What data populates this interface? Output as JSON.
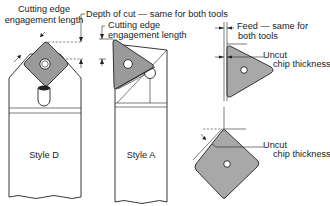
{
  "figure": {
    "labels": {
      "cutting_edge_engagement_length_left": [
        "Cutting edge",
        "engagement length"
      ],
      "depth_of_cut": "Depth of cut — same for both tools",
      "cutting_edge_engagement_length_center": [
        "Cutting edge",
        "engagement length"
      ],
      "feed": [
        "Feed — same for",
        "both tools"
      ],
      "uncut_chip_thickness_top": [
        "Uncut",
        "chip thickness"
      ],
      "uncut_chip_thickness_bottom": [
        "Uncut",
        "chip thickness"
      ],
      "style_d": "Style D",
      "style_a": "Style A"
    },
    "colors": {
      "insert_fill": "#9a9a9a",
      "line": "#222222",
      "background": "#ffffff"
    }
  }
}
